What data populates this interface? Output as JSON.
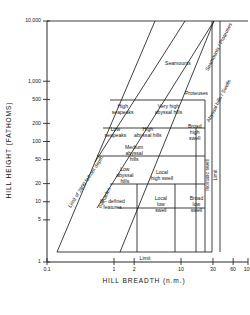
{
  "chart_data": {
    "type": "scatter",
    "title": "",
    "xlabel": "HILL BREADTH (n.m.)",
    "ylabel": "HILL HEIGHT (FATHOMS)",
    "xscale": "log",
    "yscale": "log",
    "xlim": [
      0.1,
      100
    ],
    "ylim": [
      1,
      10000
    ],
    "grid": false,
    "legend": "none",
    "xticks": [
      "0.1",
      "1",
      "2",
      "10",
      "30",
      "60",
      "100"
    ],
    "xtick_values": [
      0.1,
      1,
      2,
      10,
      30,
      60,
      100
    ],
    "yticks": [
      "1",
      "5",
      "10",
      "20",
      "50",
      "100",
      "200",
      "500",
      "1,000",
      "10,000"
    ],
    "ytick_values": [
      1,
      5,
      10,
      20,
      50,
      100,
      200,
      500,
      1000,
      10000
    ],
    "regions": [
      {
        "name": "Seamounts",
        "label": "Seamounts",
        "x": 9.0,
        "y": 1900
      },
      {
        "name": "Proteuses",
        "label": "Proteuses",
        "x": 17.0,
        "y": 620
      },
      {
        "name": "High seapeaks",
        "label": "High\nseapeaks",
        "x": 1.35,
        "y": 330
      },
      {
        "name": "Very high abyssal hills",
        "label": "Very high\nabyssal hills",
        "x": 6.5,
        "y": 330
      },
      {
        "name": "Low seapeaks",
        "label": "Low\nseapeaks",
        "x": 1.05,
        "y": 140
      },
      {
        "name": "High abyssal hills",
        "label": "High\nabyssal hills",
        "x": 3.2,
        "y": 140
      },
      {
        "name": "Broad high swell",
        "label": "Broad\nhigh\nswell",
        "x": 16.0,
        "y": 140
      },
      {
        "name": "Medium abyssal hills",
        "label": "Medium\nabyssal\nhills",
        "x": 2.0,
        "y": 62
      },
      {
        "name": "Low abyssal hills",
        "label": "Low\nabyssal\nhills",
        "x": 1.45,
        "y": 27
      },
      {
        "name": "Local high swell",
        "label": "Local\nhigh swell",
        "x": 5.2,
        "y": 27
      },
      {
        "name": "Ill-defined features",
        "label": "Ill - defined\nfeatures",
        "x": 0.95,
        "y": 9
      },
      {
        "name": "Local low swell",
        "label": "Local\nlow\nswell",
        "x": 5.0,
        "y": 9
      },
      {
        "name": "Broad low swell",
        "label": "Broad\nlow\nswell",
        "x": 17.0,
        "y": 9
      }
    ],
    "boundary_labels": [
      {
        "name": "limit-of-2800-fathom-depth",
        "label": "Limit of 2800 fathom depth",
        "orientation": "diagonal"
      },
      {
        "name": "pinnacles",
        "label": "Pinnacles",
        "orientation": "diagonal"
      },
      {
        "name": "seamounts-proteuses-boundary",
        "label": "Seamounts / Proteuses",
        "orientation": "diagonal"
      },
      {
        "name": "abyssal-hills-swells-boundary",
        "label": "Abyssal hills / Swells",
        "orientation": "diagonal"
      },
      {
        "name": "isostatic-swell",
        "label": "Isostatic swell",
        "orientation": "vertical"
      },
      {
        "name": "limit-right",
        "label": "Limit",
        "orientation": "vertical"
      },
      {
        "name": "limit-bottom",
        "label": "Limit",
        "orientation": "horizontal"
      }
    ]
  }
}
